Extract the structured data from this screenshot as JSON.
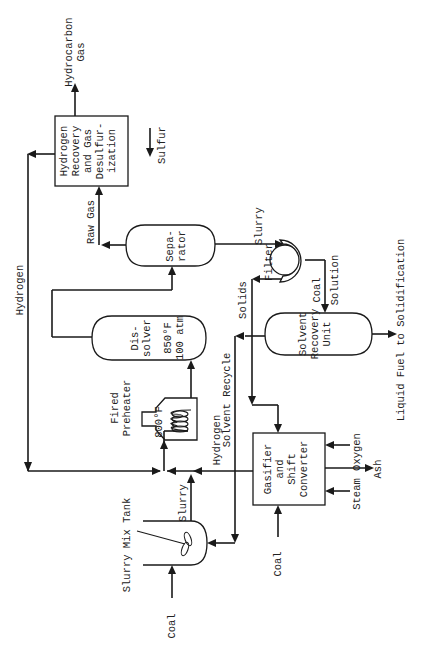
{
  "diagram": {
    "type": "process-flow",
    "orientation": "rotated-90-ccw",
    "colors": {
      "line": "#1a1a1a",
      "text": "#222222",
      "background": "#ffffff"
    },
    "units": {
      "hydrogen_recovery": {
        "lines": [
          "Hydrogen",
          "Recovery",
          "and Gas",
          "Desulfur-",
          "ization"
        ]
      },
      "separator": {
        "lines": [
          "Sepa-",
          "rator"
        ]
      },
      "dissolver": {
        "lines": [
          "Dis-",
          "solver",
          "850°F",
          "100 atm"
        ]
      },
      "preheater": {
        "lines": [
          "Fired",
          "Preheater"
        ],
        "temp": "800°F"
      },
      "filter": {
        "label": "Filter"
      },
      "solvent_recovery": {
        "lines": [
          "Solvent",
          "Recovery",
          "Unit"
        ]
      },
      "gasifier": {
        "lines": [
          "Gasifier",
          "and",
          "Shift",
          "Converter"
        ]
      },
      "slurry_mix_tank": {
        "label": "Slurry Mix Tank"
      }
    },
    "streams": {
      "hydrocarbon_gas": [
        "Hydrocarbon",
        "Gas"
      ],
      "sulfur": "Sulfur",
      "raw_gas": "Raw Gas",
      "hydrogen_recycle": "Hydrogen",
      "slurry_to_filter": "Slurry",
      "solids": "Solids",
      "coal_solution": [
        "Coal",
        "Solution"
      ],
      "liquid_fuel": "Liquid Fuel to Solidification",
      "solvent_recycle": "Solvent Recycle",
      "hydrogen_from_gasifier": "Hydrogen",
      "slurry_to_preheater": "Slurry",
      "coal_to_tank": "Coal",
      "coal_to_gasifier": "Coal",
      "oxygen": "Oxygen",
      "steam": "Steam",
      "ash": "Ash"
    }
  }
}
